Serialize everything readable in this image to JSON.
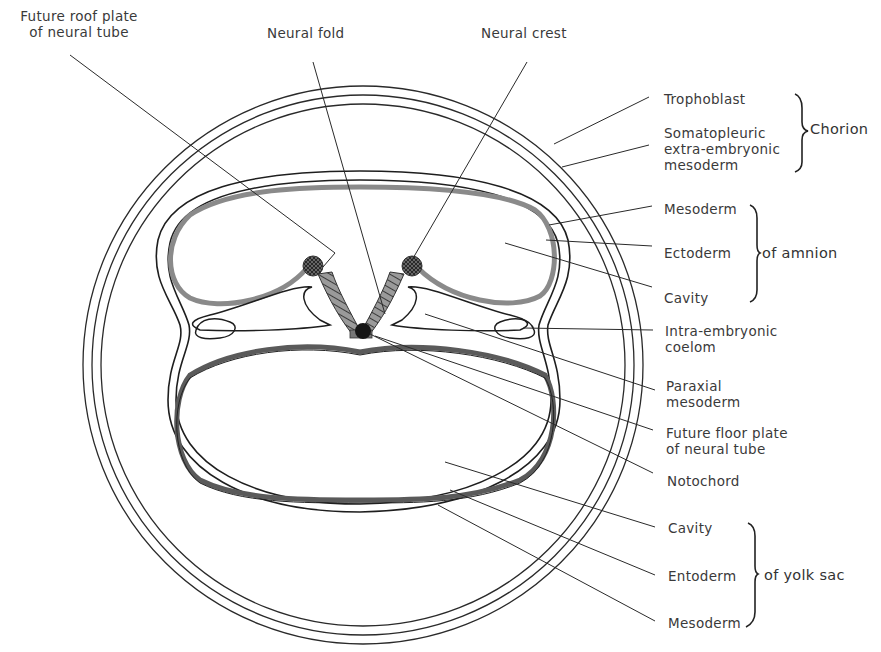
{
  "diagram": {
    "colors": {
      "line": "#222222",
      "ectoderm_gray": "#8a8a8a",
      "neural_hatch": "#5a5a5a",
      "notochord": "#1a1a1a",
      "text": "#3a3a3a"
    },
    "top_labels": {
      "roof_plate": {
        "line1": "Future roof plate",
        "line2": "of neural tube"
      },
      "neural_fold": "Neural fold",
      "neural_crest": "Neural crest"
    },
    "chorion_group": {
      "items": [
        {
          "label": "Trophoblast"
        },
        {
          "line1": "Somatopleuric",
          "line2": "extra-embryonic",
          "line3": "mesoderm"
        }
      ],
      "group_label": "Chorion"
    },
    "amnion_group": {
      "items": [
        "Mesoderm",
        "Ectoderm",
        "Cavity"
      ],
      "group_label": "of amnion"
    },
    "embryo_labels": {
      "coelom": {
        "line1": "Intra-embryonic",
        "line2": "coelom"
      },
      "paraxial": {
        "line1": "Paraxial",
        "line2": "mesoderm"
      },
      "floor_plate": {
        "line1": "Future floor plate",
        "line2": "of neural tube"
      },
      "notochord": "Notochord"
    },
    "yolk_sac_group": {
      "items": [
        "Cavity",
        "Entoderm",
        "Mesoderm"
      ],
      "group_label": "of yolk sac"
    }
  }
}
